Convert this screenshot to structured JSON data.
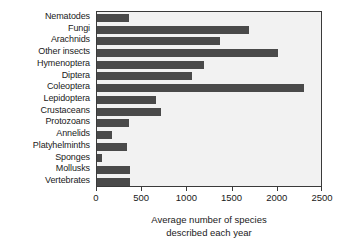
{
  "chart_data": {
    "type": "bar",
    "orientation": "horizontal",
    "title": "",
    "xlabel": "Average number of species described each year",
    "xlabel_lines": [
      "Average number of species",
      "described each year"
    ],
    "ylabel": "",
    "xlim": [
      0,
      2500
    ],
    "xticks": [
      0,
      500,
      1000,
      1500,
      2000,
      2500
    ],
    "xtick_labels": [
      "0",
      "500",
      "1000",
      "1500",
      "2000",
      "2500"
    ],
    "grid": false,
    "legend": null,
    "categories": [
      "Nematodes",
      "Fungi",
      "Arachnids",
      "Other insects",
      "Hymenoptera",
      "Diptera",
      "Coleoptera",
      "Lepidoptera",
      "Crustaceans",
      "Protozoans",
      "Annelids",
      "Platyhelminths",
      "Sponges",
      "Mollusks",
      "Vertebrates"
    ],
    "values": [
      355,
      1680,
      1360,
      2000,
      1180,
      1050,
      2290,
      650,
      710,
      355,
      170,
      330,
      60,
      370,
      360
    ],
    "bar_color": "#4a4a4a",
    "plot_background": "#f2f2f2",
    "axis_color": "#3a3a3a"
  }
}
